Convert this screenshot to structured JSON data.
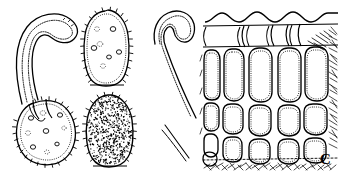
{
  "figure": {
    "type": "scientific-line-drawing",
    "discipline": "botanical-mycological illustration",
    "background_color": "#ffffff",
    "ink_color": "#000000",
    "width": 339,
    "height": 174,
    "panel_label": "C",
    "panels": [
      {
        "id": "panel-left",
        "name": "germinating-spore-with-germ-tube",
        "description": "Ovoid echinulate (spiny) spore at lower left with a long curved germ tube arching upward and to the right; spore interior shows scattered oil droplets / vacuoles."
      },
      {
        "id": "panel-spore-spotted",
        "name": "spiny-spore-with-oil-droplets",
        "description": "Upper middle: ovoid spore with marginal spines and several internal circular oil droplets."
      },
      {
        "id": "panel-spore-stippled",
        "name": "spiny-spore-stippled-ornamentation",
        "description": "Lower middle: ovoid spore with dense stippled verrucose surface ornamentation and marginal spines."
      },
      {
        "id": "panel-germ-tube",
        "name": "detached-germ-tube",
        "description": "Middle right: hook-shaped curved germ tube / hypha with double-walled outline."
      },
      {
        "id": "panel-tissue-section",
        "name": "tissue-cross-section",
        "description": "Right: cross-section of plant tissue showing a wavy cuticle, a layer of flattened epidermal cells, and several tiers of large rounded palisade-like cells with hatched shading at the margins."
      }
    ]
  },
  "labels": {
    "panel_letter": "C"
  },
  "structures": {
    "germ_tube": "germ-tube",
    "spore_body": "spore-body",
    "spine": "spine",
    "oil_droplet": "oil-droplet",
    "cuticle": "cuticle-layer",
    "epidermal_cell": "epidermal-cell",
    "parenchyma_cell": "parenchyma-cell",
    "hatching": "hatched-shading"
  }
}
